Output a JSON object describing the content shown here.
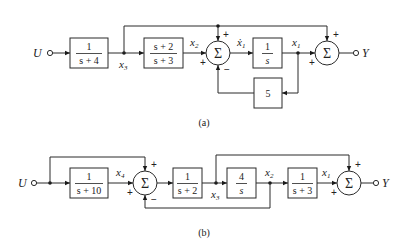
{
  "diagram_a": {
    "caption": "(a)",
    "input_label": "U",
    "output_label": "Y",
    "blocks": [
      {
        "id": "G1",
        "num": "1",
        "den": "s + 4"
      },
      {
        "id": "G2",
        "num": "s + 2",
        "den": "s + 3"
      },
      {
        "id": "G3",
        "num": "1",
        "den": "s"
      },
      {
        "id": "K",
        "gain": "5"
      }
    ],
    "signals": {
      "x3": "x",
      "x3_sub": "3",
      "x2": "x",
      "x2_sub": "2",
      "x1dot": "ẋ",
      "x1dot_sub": "1",
      "x1": "x",
      "x1_sub": "1"
    },
    "sum1": {
      "symbol": "Σ",
      "top": "+",
      "left": "+",
      "bottom": "−"
    },
    "sum2": {
      "symbol": "Σ",
      "top": "+",
      "left": "+"
    }
  },
  "diagram_b": {
    "caption": "(b)",
    "input_label": "U",
    "output_label": "Y",
    "blocks": [
      {
        "id": "G1",
        "num": "1",
        "den": "s + 10"
      },
      {
        "id": "G2",
        "num": "1",
        "den": "s + 2"
      },
      {
        "id": "G3",
        "num": "4",
        "den": "s"
      },
      {
        "id": "G4",
        "num": "1",
        "den": "s + 3"
      }
    ],
    "signals": {
      "x4": "x",
      "x4_sub": "4",
      "x3": "x",
      "x3_sub": "3",
      "x2": "x",
      "x2_sub": "2",
      "x1": "x",
      "x1_sub": "1"
    },
    "sum1": {
      "symbol": "Σ",
      "top": "+",
      "left": "+",
      "bottom": "−"
    },
    "sum2": {
      "symbol": "Σ",
      "top": "+",
      "left": "+"
    }
  }
}
